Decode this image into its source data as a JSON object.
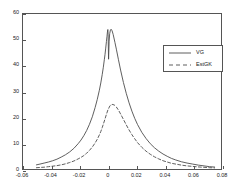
{
  "chart_data": {
    "type": "line",
    "title": "",
    "xlabel": "",
    "ylabel": "",
    "xlim": [
      -0.06,
      0.08
    ],
    "ylim": [
      0,
      60
    ],
    "grid": false,
    "legend_position": "upper right",
    "xticks": [
      "-0.06",
      "-0.04",
      "-0.02",
      "0",
      "0.02",
      "0.04",
      "0.06",
      "0.08"
    ],
    "xtick_values": [
      -0.06,
      -0.04,
      -0.02,
      0,
      0.02,
      0.04,
      0.06,
      0.08
    ],
    "yticks": [
      "0",
      "10",
      "20",
      "30",
      "40",
      "50",
      "60"
    ],
    "ytick_values": [
      0,
      10,
      20,
      30,
      40,
      50,
      60
    ],
    "series": [
      {
        "name": "VG",
        "style": "solid",
        "color": "#4d4d4d",
        "peak_value": 54,
        "peak_x": -0.0008,
        "cusp_notch_value": 42.5,
        "cusp_notch_x": 0.0005,
        "x": [
          -0.0505,
          -0.048,
          -0.045,
          -0.042,
          -0.039,
          -0.036,
          -0.033,
          -0.03,
          -0.027,
          -0.024,
          -0.021,
          -0.019,
          -0.017,
          -0.015,
          -0.013,
          -0.011,
          -0.009,
          -0.0075,
          -0.006,
          -0.005,
          -0.004,
          -0.0032,
          -0.0025,
          -0.002,
          -0.0015,
          -0.001,
          -0.0006,
          -0.0003,
          -0.0001,
          0,
          0.0002,
          0.0005,
          0.0009,
          0.0013,
          0.0018,
          0.0023,
          0.003,
          0.0038,
          0.005,
          0.006,
          0.0075,
          0.009,
          0.011,
          0.013,
          0.015,
          0.017,
          0.019,
          0.021,
          0.024,
          0.027,
          0.03,
          0.033,
          0.036,
          0.039,
          0.042,
          0.045,
          0.048,
          0.052,
          0.056,
          0.06,
          0.064,
          0.068,
          0.072,
          0.0755
        ],
        "y": [
          1.6,
          1.9,
          2.3,
          2.7,
          3.2,
          3.8,
          4.6,
          5.5,
          6.6,
          8.0,
          9.8,
          11.2,
          12.9,
          14.9,
          17.3,
          20.2,
          23.8,
          26.9,
          30.5,
          33.3,
          36.5,
          39.4,
          42.3,
          44.4,
          46.8,
          49.4,
          51.4,
          53.0,
          53.8,
          54.0,
          52.0,
          42.5,
          49.5,
          52.4,
          53.8,
          54.1,
          53.5,
          52.0,
          49.0,
          46.4,
          42.3,
          38.3,
          33.5,
          29.3,
          25.6,
          22.4,
          19.6,
          17.2,
          14.2,
          11.8,
          9.8,
          8.2,
          6.9,
          5.8,
          4.9,
          4.1,
          3.5,
          2.8,
          2.3,
          1.9,
          1.5,
          1.2,
          0.9,
          0.75
        ]
      },
      {
        "name": "EstGK",
        "style": "dashed",
        "color": "#4d4d4d",
        "peak_value": 25,
        "peak_x": 0.0015,
        "x": [
          -0.0505,
          -0.048,
          -0.045,
          -0.042,
          -0.039,
          -0.036,
          -0.033,
          -0.03,
          -0.027,
          -0.024,
          -0.021,
          -0.019,
          -0.017,
          -0.015,
          -0.013,
          -0.011,
          -0.009,
          -0.0075,
          -0.006,
          -0.005,
          -0.004,
          -0.003,
          -0.002,
          -0.001,
          0,
          0.0015,
          0.003,
          0.0045,
          0.006,
          0.0075,
          0.009,
          0.011,
          0.013,
          0.015,
          0.017,
          0.019,
          0.021,
          0.024,
          0.027,
          0.03,
          0.033,
          0.036,
          0.039,
          0.042,
          0.045,
          0.048,
          0.052,
          0.056,
          0.06,
          0.064,
          0.068,
          0.072,
          0.0755
        ],
        "y": [
          0.5,
          0.6,
          0.7,
          0.9,
          1.1,
          1.3,
          1.6,
          2.0,
          2.5,
          3.1,
          3.9,
          4.5,
          5.2,
          6.1,
          7.2,
          8.5,
          10.1,
          11.5,
          13.2,
          14.5,
          16.0,
          17.7,
          19.4,
          21.2,
          22.8,
          24.5,
          25.0,
          24.8,
          24.0,
          22.8,
          21.3,
          19.2,
          17.1,
          15.1,
          13.3,
          11.7,
          10.2,
          8.4,
          6.9,
          5.7,
          4.7,
          3.9,
          3.2,
          2.7,
          2.2,
          1.9,
          1.5,
          1.2,
          1.0,
          0.8,
          0.65,
          0.5,
          0.42
        ]
      }
    ]
  },
  "legend": {
    "items": [
      {
        "label": "VG"
      },
      {
        "label": "EstGK"
      }
    ]
  }
}
